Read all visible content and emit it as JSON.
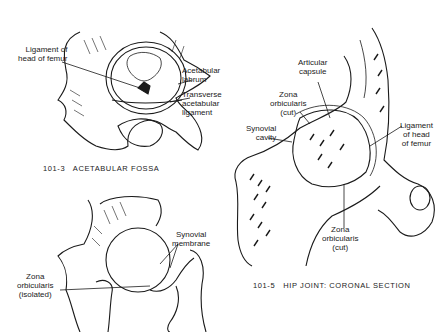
{
  "header_fragments": {
    "left": "",
    "right": ""
  },
  "figures": [
    {
      "id": "101-3",
      "caption": "101-3   ACETABULAR FOSSA",
      "labels": {
        "ligament_of_head_of_femur": "Ligament of\nhead of femur",
        "acetabular_labrum": "Acetabular\nlabrum",
        "transverse_acetabular_ligament": "Transverse\nacetabular\nligament"
      }
    },
    {
      "id": "101-5",
      "caption": "101-5   HIP JOINT: CORONAL SECTION",
      "labels": {
        "articular_capsule": "Articular\ncapsule",
        "zona_orbicularis_cut_upper": "Zona\norbicularis\n(cut)",
        "synovial_cavity": "Synovial\ncavity",
        "ligament_of_head_of_femur": "Ligament\nof head\nof femur",
        "zona_orbicularis_cut_lower": "Zona\norbicularis\n(cut)"
      }
    },
    {
      "id": "101-4",
      "caption": "",
      "labels": {
        "synovial_membrane": "Synovial\nmembrane",
        "zona_orbicularis_isolated": "Zona\norbicularis\n(isolated)"
      }
    }
  ],
  "colors": {
    "ink": "#1a1a1a",
    "paper": "#ffffff"
  }
}
